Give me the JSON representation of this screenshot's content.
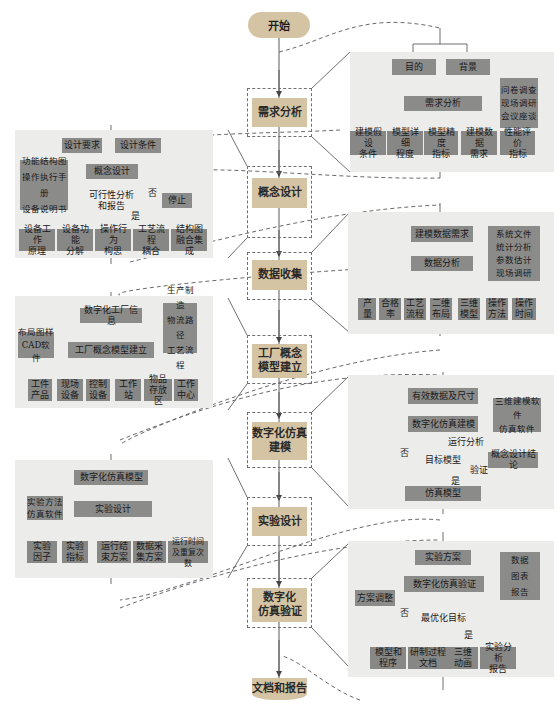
{
  "main_flow": {
    "start": "开始",
    "steps": [
      {
        "id": "requirements",
        "label": "需求分析"
      },
      {
        "id": "concept",
        "label": "概念设计"
      },
      {
        "id": "data",
        "label": "数据收集"
      },
      {
        "id": "factory",
        "label": "工厂概念\n模型建立"
      },
      {
        "id": "sim",
        "label": "数字化仿真\n建模"
      },
      {
        "id": "experiment",
        "label": "实验设计"
      },
      {
        "id": "verify",
        "label": "数字化\n仿真验证"
      }
    ],
    "end": "文档和报告"
  },
  "panels": {
    "requirements": {
      "top": [
        "目的",
        "背景"
      ],
      "center": "需求分析",
      "inputs": [
        "问卷调查",
        "现场调研",
        "会议座谈"
      ],
      "outputs": [
        "建模假设\n条件",
        "模型详细\n程度",
        "模型精度\n指标",
        "建模数据\n需求",
        "性能评价\n指标"
      ]
    },
    "concept": {
      "top": [
        "设计要求",
        "设计条件"
      ],
      "center": "概念设计",
      "inputs": [
        "功能结构图",
        "操作执行手册",
        "设备说明书"
      ],
      "decision": "可行性分析\n和报告",
      "no_label": "否",
      "yes_label": "是",
      "stop": "停止",
      "outputs": [
        "设备工作\n原理",
        "设备功能\n分解",
        "操作行为\n构思",
        "工艺流程\n耦合",
        "结构图\n融合集成"
      ]
    },
    "data": {
      "top": "建模数据需求",
      "center": "数据分析",
      "inputs": [
        "系统文件",
        "统计分析",
        "参数估计",
        "现场调研"
      ],
      "outputs": [
        "产\n量",
        "合格\n率",
        "工艺\n流程",
        "二维\n布局",
        "三维\n模型",
        "操作\n方法",
        "操作\n时间"
      ]
    },
    "factory": {
      "top": "数字化工厂信息",
      "center": "工厂概念模型建立",
      "left_inputs": [
        "布局图样",
        "CAD软件"
      ],
      "right_inputs": [
        "生产制造",
        "物流路径",
        "工艺流程"
      ],
      "outputs": [
        "工件\n产品",
        "现场\n设备",
        "控制\n设备",
        "工作站",
        "物品\n存放区",
        "工作\n中心"
      ]
    },
    "sim": {
      "top": "有效数据及尺寸",
      "center": "数字化仿真建模",
      "inputs": [
        "三维建模软件",
        "仿真软件"
      ],
      "run_label": "运行分析",
      "decision": "目标模型",
      "no_label": "否",
      "yes_label": "是",
      "verify_label": "验证",
      "concept_input": "概念设计结论",
      "output": "仿真模型"
    },
    "experiment": {
      "top": "数字化仿真模型",
      "center": "实验设计",
      "inputs": [
        "实验方法",
        "仿真软件"
      ],
      "outputs": [
        "实验\n因子",
        "实验\n指标",
        "运行结\n束方案",
        "数据采\n集方案",
        "运行时间\n及重复次数"
      ]
    },
    "verify": {
      "top": "实验方案",
      "center": "数字化仿真验证",
      "inputs": [
        "数据",
        "图表",
        "报告"
      ],
      "adjust": "方案调整",
      "decision": "最优化目标",
      "no_label": "否",
      "yes_label": "是",
      "outputs": [
        "模型和\n程序",
        "研制过程\n文档",
        "三维\n动画",
        "实验分析\n报告"
      ]
    }
  },
  "colors": {
    "main_step": "#d5c4a3",
    "panel_bg": "#ececeb",
    "box_gray": "#8b8b8a",
    "line": "#555555"
  }
}
